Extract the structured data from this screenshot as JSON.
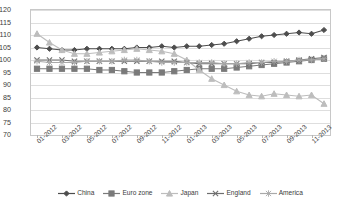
{
  "chart_data": {
    "type": "line",
    "title": "",
    "xlabel": "",
    "ylabel": "",
    "ylim": [
      70,
      120
    ],
    "ytick_step": 5,
    "grid": true,
    "legend_position": "bottom",
    "yticks": [
      "70",
      "75",
      "80",
      "85",
      "90",
      "95",
      "100",
      "105",
      "110",
      "115",
      "120"
    ],
    "categories": [
      "01-2012",
      "02-2012",
      "03-2012",
      "04-2012",
      "05-2012",
      "06-2012",
      "07-2012",
      "08-2012",
      "09-2012",
      "10-2012",
      "11-2012",
      "12-2012",
      "01-2013",
      "02-2013",
      "03-2013",
      "04-2013",
      "05-2013",
      "06-2013",
      "07-2013",
      "08-2013",
      "09-2013",
      "10-2013",
      "11-2013",
      "12-2013"
    ],
    "xtick_labels": [
      "01-2012",
      "03-2012",
      "05-2012",
      "07-2012",
      "09-2012",
      "11-2012",
      "01-2013",
      "03-2013",
      "05-2013",
      "07-2013",
      "09-2013",
      "11-2013"
    ],
    "series": [
      {
        "name": "China",
        "color": "#4d4d4d",
        "marker": "diamond",
        "values": [
          105,
          104.5,
          104,
          104,
          104.5,
          104.5,
          104.5,
          104.5,
          105,
          105,
          105.5,
          105,
          105.5,
          105.5,
          106,
          106.5,
          107.5,
          108.5,
          109.5,
          110,
          110.5,
          111,
          110.5,
          112
        ]
      },
      {
        "name": "Euro zone",
        "color": "#7a7a7a",
        "marker": "square",
        "values": [
          96.5,
          96.5,
          96.5,
          96.5,
          96.5,
          96,
          96,
          95.5,
          95,
          95,
          95,
          95.5,
          96,
          96.5,
          96.5,
          96.5,
          97,
          97.5,
          98,
          98.5,
          99,
          99.5,
          100,
          100.5
        ]
      },
      {
        "name": "Japan",
        "color": "#bdbdbd",
        "marker": "triangle",
        "values": [
          110.5,
          107,
          104,
          102.5,
          102.5,
          103,
          103.5,
          104,
          104.5,
          104,
          103.5,
          102.5,
          100,
          96,
          92.5,
          90,
          87.5,
          86,
          85.5,
          86.5,
          86,
          85.5,
          86,
          82.5
        ]
      },
      {
        "name": "England",
        "color": "#6e6e6e",
        "marker": "cross",
        "values": [
          100,
          100,
          100,
          99.5,
          99.5,
          99.5,
          99.5,
          99.5,
          99.5,
          99.5,
          99.5,
          99.5,
          99,
          98.5,
          98.5,
          98.5,
          98.5,
          98.5,
          99,
          99,
          99.5,
          100,
          100.5,
          101
        ]
      },
      {
        "name": "America",
        "color": "#a9a9a9",
        "marker": "asterisk",
        "values": [
          99.5,
          99,
          99,
          99,
          99.5,
          99.5,
          99.5,
          100,
          100,
          99.5,
          99,
          99,
          99,
          99,
          99,
          98.5,
          98.5,
          99,
          99,
          99.5,
          99.5,
          100,
          100,
          100.5
        ]
      }
    ]
  }
}
